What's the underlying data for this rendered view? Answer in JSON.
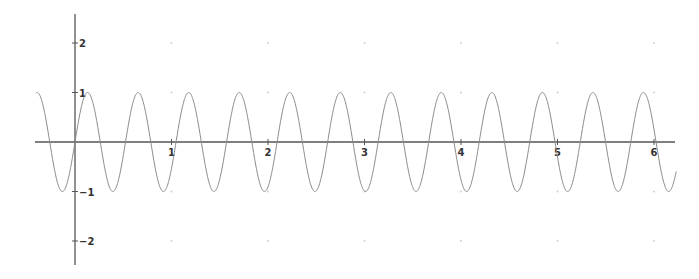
{
  "chart_data": {
    "type": "line",
    "title": "",
    "xlabel": "",
    "ylabel": "",
    "function": "y = sin(12x)",
    "xlim": [
      -0.42,
      6.25
    ],
    "ylim": [
      -2.5,
      2.6
    ],
    "x_ticks": [
      1,
      2,
      3,
      4,
      5,
      6
    ],
    "y_ticks": [
      -2,
      -1,
      1,
      2
    ],
    "x_tick_labels": [
      "1",
      "2",
      "3",
      "4",
      "5",
      "6"
    ],
    "y_tick_labels": [
      "-2",
      "-1",
      "1",
      "2"
    ],
    "grid": "dots at integer lattice points",
    "legend": null,
    "series": [
      {
        "name": "sin(12x)",
        "domain": [
          -0.406,
          6.23
        ],
        "amplitude": 1,
        "angular_frequency": 12,
        "period": 0.5236,
        "sample_points": [
          {
            "x": -0.406,
            "y": 1
          },
          {
            "x": 0,
            "y": 0
          },
          {
            "x": 0.131,
            "y": 1
          },
          {
            "x": 0.262,
            "y": 0
          },
          {
            "x": 0.393,
            "y": -1
          },
          {
            "x": 0.524,
            "y": 0
          },
          {
            "x": 0.654,
            "y": 1
          },
          {
            "x": 1.178,
            "y": 1
          },
          {
            "x": 1.702,
            "y": 1
          },
          {
            "x": 2.225,
            "y": 1
          },
          {
            "x": 2.749,
            "y": 1
          },
          {
            "x": 3.272,
            "y": 1
          },
          {
            "x": 3.796,
            "y": 1
          },
          {
            "x": 4.32,
            "y": 1
          },
          {
            "x": 4.843,
            "y": 1
          },
          {
            "x": 5.367,
            "y": 1
          },
          {
            "x": 5.89,
            "y": 1
          },
          {
            "x": 6.23,
            "y": -0.55
          }
        ]
      }
    ]
  },
  "style": {
    "curve_color": "#8a8a8a",
    "axis_color": "#555555",
    "grid_dot_color": "#cccccc",
    "label_color": "#333333"
  },
  "layout": {
    "origin_px": [
      75,
      142
    ],
    "x_px_per_unit": 96.5,
    "y_px_per_unit": 49.5,
    "x_axis_px": [
      35,
      675
    ],
    "y_axis_px": [
      14,
      265
    ]
  }
}
